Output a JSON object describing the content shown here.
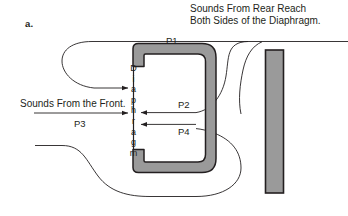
{
  "figure": {
    "panel_label": "a.",
    "caption_rear_line1": "Sounds From Rear Reach",
    "caption_rear_line2": "Both Sides of the Diaphragm.",
    "caption_front": "Sounds From the Front.",
    "diaphragm_label": "Diaphragm",
    "diaphragm_letters": [
      "D",
      "i",
      "a",
      "p",
      "h",
      "r",
      "a",
      "g",
      "m"
    ]
  },
  "paths": {
    "p1": {
      "label": "P1",
      "description": "rear sound path over top of housing"
    },
    "p2": {
      "label": "P2",
      "description": "rear sound path entering rear of diaphragm, upper"
    },
    "p3": {
      "label": "P3",
      "description": "front sound path striking front of diaphragm"
    },
    "p4": {
      "label": "P4",
      "description": "rear sound path entering rear of diaphragm, lower"
    }
  },
  "colors": {
    "housing_fill": "#9a9a9a",
    "housing_stroke": "#231f20",
    "bar_fill": "#9a9a9a",
    "bar_stroke": "#231f20",
    "line": "#231f20",
    "background": "#ffffff",
    "text": "#231f20"
  }
}
